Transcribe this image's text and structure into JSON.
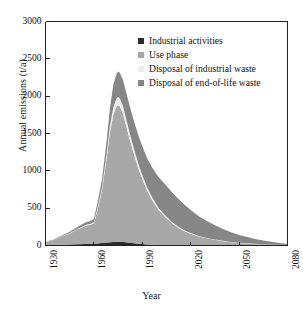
{
  "chart_data": {
    "type": "area",
    "title": "",
    "xlabel": "Year",
    "ylabel": "Annual emissions (t/a)",
    "xlim": [
      1930,
      2080
    ],
    "ylim": [
      0,
      3000
    ],
    "xticks": [
      1930,
      1960,
      1990,
      2020,
      2050,
      2080
    ],
    "yticks": [
      0,
      500,
      1000,
      1500,
      2000,
      2500,
      3000
    ],
    "grid": false,
    "stacked": true,
    "legend_position": "top-right inside",
    "x": [
      1930,
      1935,
      1940,
      1945,
      1950,
      1955,
      1958,
      1960,
      1962,
      1965,
      1968,
      1970,
      1972,
      1974,
      1975,
      1976,
      1978,
      1980,
      1982,
      1985,
      1988,
      1990,
      1993,
      1996,
      2000,
      2004,
      2008,
      2012,
      2016,
      2020,
      2025,
      2030,
      2035,
      2040,
      2045,
      2050,
      2055,
      2060,
      2065,
      2070,
      2075,
      2080
    ],
    "series": [
      {
        "name": "Industrial activities",
        "color": "#2b2b2b",
        "values": [
          4,
          6,
          9,
          12,
          16,
          20,
          22,
          24,
          28,
          34,
          40,
          44,
          48,
          50,
          50,
          49,
          46,
          42,
          37,
          30,
          24,
          20,
          15,
          11,
          8,
          6,
          4,
          3,
          2,
          2,
          1,
          1,
          1,
          0,
          0,
          0,
          0,
          0,
          0,
          0,
          0,
          0
        ]
      },
      {
        "name": "Use phase",
        "color": "#a8a8a8",
        "values": [
          40,
          70,
          110,
          150,
          200,
          245,
          255,
          275,
          430,
          700,
          1150,
          1480,
          1700,
          1810,
          1830,
          1815,
          1720,
          1560,
          1400,
          1180,
          980,
          870,
          720,
          600,
          470,
          380,
          300,
          240,
          190,
          155,
          120,
          95,
          75,
          58,
          45,
          35,
          27,
          21,
          16,
          12,
          9,
          6
        ]
      },
      {
        "name": "Disposal of industrial waste",
        "color": "#ededed",
        "values": [
          2,
          3,
          5,
          7,
          10,
          13,
          14,
          16,
          24,
          40,
          65,
          85,
          100,
          108,
          110,
          109,
          104,
          95,
          86,
          73,
          61,
          54,
          45,
          37,
          29,
          23,
          18,
          15,
          12,
          9,
          7,
          6,
          5,
          4,
          3,
          2,
          2,
          1,
          1,
          1,
          0,
          0
        ]
      },
      {
        "name": "Disposal of end-of-life waste",
        "color": "#868686",
        "values": [
          3,
          6,
          10,
          16,
          24,
          34,
          38,
          44,
          66,
          105,
          170,
          240,
          300,
          330,
          340,
          345,
          350,
          355,
          360,
          370,
          380,
          385,
          390,
          400,
          410,
          415,
          400,
          375,
          345,
          310,
          265,
          225,
          190,
          158,
          130,
          105,
          85,
          66,
          50,
          36,
          24,
          14
        ]
      }
    ]
  },
  "axis": {
    "ytick_labels": [
      "0",
      "500",
      "1000",
      "1500",
      "2000",
      "2500",
      "3000"
    ],
    "xtick_labels": [
      "1930",
      "1960",
      "1990",
      "2020",
      "2050",
      "2080"
    ],
    "ylabel": "Annual emissions (t/a)",
    "xlabel": "Year"
  },
  "legend": {
    "items": [
      {
        "label": "Industrial activities",
        "color": "#2b2b2b"
      },
      {
        "label": "Use phase",
        "color": "#a8a8a8"
      },
      {
        "label": "Disposal of industrial waste",
        "color": "#ededed"
      },
      {
        "label": "Disposal of end-of-life waste",
        "color": "#868686"
      }
    ]
  },
  "frame": {
    "color": "#222222"
  }
}
